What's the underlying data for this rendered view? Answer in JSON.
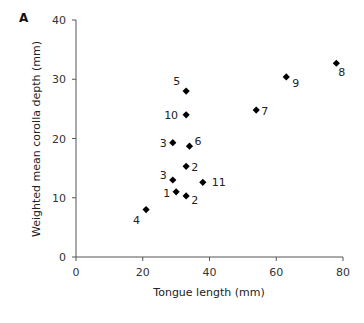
{
  "panel_label": "A",
  "chart_data": {
    "type": "scatter",
    "title": "",
    "xlabel": "Tongue length (mm)",
    "ylabel": "Weighted mean corolla depth (mm)",
    "xlim": [
      0,
      80
    ],
    "ylim": [
      0,
      40
    ],
    "xticks": [
      0,
      20,
      40,
      60,
      80
    ],
    "yticks": [
      0,
      10,
      20,
      30,
      40
    ],
    "grid": false,
    "legend": null,
    "marker": "diamond",
    "marker_color": "#000000",
    "points": [
      {
        "label": "1",
        "x": 30,
        "y": 11.0
      },
      {
        "label": "2",
        "x": 33,
        "y": 15.3
      },
      {
        "label": "2",
        "x": 33,
        "y": 10.3
      },
      {
        "label": "3",
        "x": 29,
        "y": 19.3
      },
      {
        "label": "3",
        "x": 29,
        "y": 13.0
      },
      {
        "label": "4",
        "x": 21,
        "y": 8.0
      },
      {
        "label": "5",
        "x": 33,
        "y": 28.0
      },
      {
        "label": "6",
        "x": 34,
        "y": 18.7
      },
      {
        "label": "7",
        "x": 54,
        "y": 24.8
      },
      {
        "label": "8",
        "x": 78,
        "y": 32.7
      },
      {
        "label": "9",
        "x": 63,
        "y": 30.4
      },
      {
        "label": "10",
        "x": 33,
        "y": 24.0
      },
      {
        "label": "11",
        "x": 38,
        "y": 12.6
      }
    ]
  }
}
